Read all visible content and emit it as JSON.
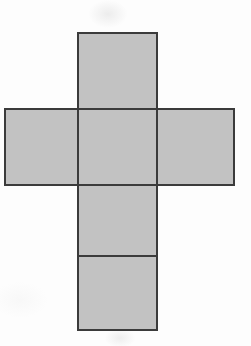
{
  "document": {
    "kind": "geometry-figure",
    "title": "Cube net",
    "background_color": "#fdfdfd"
  },
  "figure": {
    "name": "cube-net-cross",
    "fill_color": "#c2c2c2",
    "line_color": "#3b3b3b",
    "line_width": 2,
    "unit_square_px": 78,
    "bounds": {
      "x": 5,
      "y": 33,
      "width": 229,
      "height": 297
    },
    "faces": [
      {
        "id": "top-face",
        "label": "top",
        "x": 78,
        "y": 33,
        "width": 79,
        "height": 76
      },
      {
        "id": "left-face",
        "label": "left",
        "x": 5,
        "y": 109,
        "width": 73,
        "height": 76
      },
      {
        "id": "center-face",
        "label": "front",
        "x": 78,
        "y": 109,
        "width": 79,
        "height": 76
      },
      {
        "id": "right-face",
        "label": "right",
        "x": 157,
        "y": 109,
        "width": 77,
        "height": 76
      },
      {
        "id": "bottom-face",
        "label": "bottom",
        "x": 78,
        "y": 185,
        "width": 79,
        "height": 71
      },
      {
        "id": "back-face",
        "label": "back",
        "x": 78,
        "y": 256,
        "width": 79,
        "height": 74
      }
    ],
    "fold_lines": [
      {
        "id": "fold-top-center",
        "orientation": "horizontal",
        "x1": 78,
        "y1": 109,
        "x2": 157,
        "y2": 109
      },
      {
        "id": "fold-center-bottom",
        "orientation": "horizontal",
        "x1": 78,
        "y1": 185,
        "x2": 157,
        "y2": 185
      },
      {
        "id": "fold-bottom-back",
        "orientation": "horizontal",
        "x1": 78,
        "y1": 256,
        "x2": 157,
        "y2": 256
      },
      {
        "id": "fold-left-center",
        "orientation": "vertical",
        "x1": 78,
        "y1": 109,
        "x2": 78,
        "y2": 185
      },
      {
        "id": "fold-center-right",
        "orientation": "vertical",
        "x1": 157,
        "y1": 109,
        "x2": 157,
        "y2": 185
      }
    ],
    "outline_path": "M 78 33 L 157 33 L 157 109 L 234 109 L 234 185 L 157 185 L 157 330 L 78 330 L 78 185 L 5 185 L 5 109 L 78 109 Z"
  }
}
